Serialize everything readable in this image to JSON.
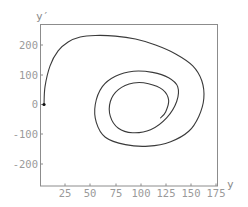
{
  "chart_data": {
    "type": "line",
    "title": "",
    "xlabel": "y",
    "ylabel": "y′",
    "xlim": [
      0,
      176
    ],
    "ylim": [
      -274,
      271
    ],
    "grid": false,
    "legend": null,
    "x_ticks": [
      25,
      50,
      75,
      100,
      125,
      150,
      175
    ],
    "y_ticks": [
      -200,
      -100,
      0,
      100,
      200
    ],
    "series": [
      {
        "name": "phase trajectory",
        "start_marker": [
          4,
          0
        ],
        "points": [
          [
            4,
            0
          ],
          [
            5,
            60
          ],
          [
            10,
            130
          ],
          [
            18,
            180
          ],
          [
            28,
            210
          ],
          [
            40,
            227
          ],
          [
            55,
            232
          ],
          [
            75,
            230
          ],
          [
            95,
            220
          ],
          [
            115,
            200
          ],
          [
            135,
            170
          ],
          [
            152,
            130
          ],
          [
            161,
            80
          ],
          [
            163,
            20
          ],
          [
            158,
            -40
          ],
          [
            148,
            -90
          ],
          [
            130,
            -125
          ],
          [
            108,
            -140
          ],
          [
            85,
            -135
          ],
          [
            65,
            -110
          ],
          [
            56,
            -60
          ],
          [
            55,
            0
          ],
          [
            62,
            60
          ],
          [
            75,
            95
          ],
          [
            93,
            112
          ],
          [
            112,
            108
          ],
          [
            128,
            90
          ],
          [
            137,
            60
          ],
          [
            136,
            10
          ],
          [
            126,
            -45
          ],
          [
            110,
            -85
          ],
          [
            92,
            -95
          ],
          [
            78,
            -80
          ],
          [
            70,
            -40
          ],
          [
            70,
            10
          ],
          [
            78,
            50
          ],
          [
            93,
            72
          ],
          [
            108,
            70
          ],
          [
            122,
            50
          ],
          [
            128,
            15
          ],
          [
            125,
            -25
          ],
          [
            120,
            -45
          ]
        ]
      }
    ]
  },
  "axes": {
    "x_label": "y",
    "y_label": "y′",
    "x_tick_labels": [
      "25",
      "50",
      "75",
      "100",
      "125",
      "150",
      "175"
    ],
    "y_tick_labels": [
      "200",
      "100",
      "0",
      "-100",
      "-200"
    ]
  },
  "colors": {
    "curve": "#3a3a3a",
    "frame": "#8c8c8c",
    "tick_text": "#9a9a9a"
  }
}
